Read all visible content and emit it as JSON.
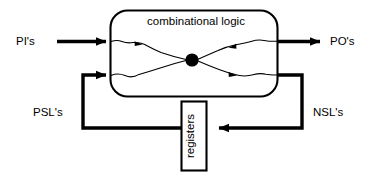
{
  "diagram": {
    "type": "block-diagram",
    "background_color": "#ffffff",
    "line_color": "#000000",
    "blocks": [
      {
        "id": "combinational-logic",
        "label": "combinational logic",
        "shape": "rounded-rectangle",
        "x": 110,
        "y": 10,
        "width": 168,
        "height": 87
      },
      {
        "id": "registers",
        "label": "registers",
        "shape": "rectangle",
        "orientation": "vertical",
        "text_rotation": -90,
        "x": 181,
        "y": 101,
        "width": 26,
        "height": 70
      }
    ],
    "signals": [
      {
        "id": "pi",
        "label": "PI's",
        "direction": "input",
        "side": "left",
        "x": 16,
        "y": 41
      },
      {
        "id": "po",
        "label": "PO's",
        "direction": "output",
        "side": "right",
        "x": 330,
        "y": 41
      },
      {
        "id": "psl",
        "label": "PSL's",
        "direction": "feedback",
        "side": "left",
        "x": 33,
        "y": 113
      },
      {
        "id": "nsl",
        "label": "NSL's",
        "direction": "feedback",
        "side": "right",
        "x": 313,
        "y": 113
      }
    ],
    "internal": {
      "junction_dot": {
        "x": 192,
        "y": 60,
        "r": 6.5
      },
      "wire_style": "squiggly",
      "wire_count": 2
    }
  }
}
